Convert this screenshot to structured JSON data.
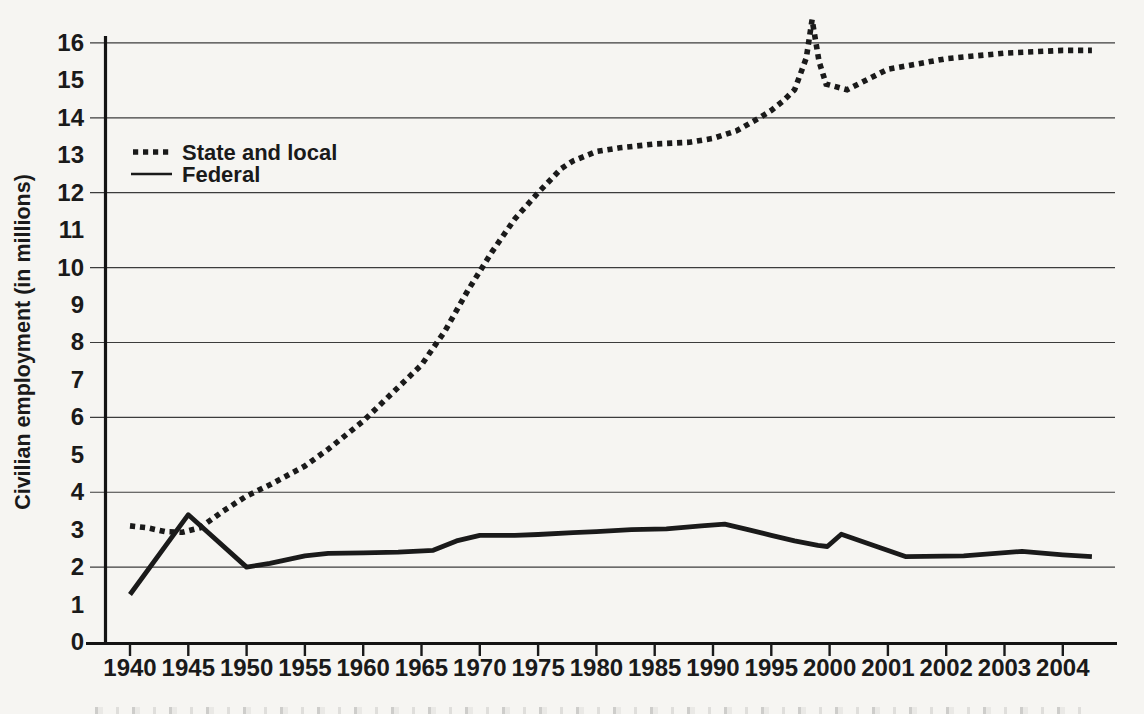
{
  "figure": {
    "background_color": "#f6f5f2",
    "ink_color": "#1a1a1a"
  },
  "chart_data": {
    "type": "line",
    "title": "",
    "xlabel": "",
    "ylabel": "Civilian employment (in millions)",
    "ylim": [
      0,
      16
    ],
    "y_tick_labels": [
      "0",
      "1",
      "2",
      "3",
      "4",
      "5",
      "6",
      "7",
      "8",
      "9",
      "10",
      "11",
      "12",
      "13",
      "14",
      "15",
      "16"
    ],
    "x_tick_labels": [
      "1940",
      "1945",
      "1950",
      "1955",
      "1960",
      "1965",
      "1970",
      "1975",
      "1980",
      "1985",
      "1990",
      "1995",
      "2000",
      "2001",
      "2002",
      "2003",
      "2004"
    ],
    "x_axis_note": "ticks evenly spaced: 5-year steps 1940-2000, then 1-year steps 2000-2004",
    "grid": "horizontal gridlines at even values 2 through 16 only",
    "legend_position": "upper left inside plot",
    "legend": [
      {
        "label": "State and local",
        "style": "dotted"
      },
      {
        "label": "Federal",
        "style": "solid"
      }
    ],
    "series": [
      {
        "name": "State and local",
        "style": "dotted",
        "values_at_ticks": [
          3.1,
          2.95,
          3.9,
          4.7,
          5.9,
          7.4,
          9.9,
          12.0,
          13.1,
          13.3,
          13.45,
          14.2,
          14.8,
          15.3,
          15.6,
          15.75,
          15.8
        ],
        "peak": {
          "year": 1998.5,
          "value": 16.6
        },
        "points": [
          [
            1940,
            3.1
          ],
          [
            1941.5,
            3.05
          ],
          [
            1943,
            2.95
          ],
          [
            1944.5,
            2.93
          ],
          [
            1946,
            3.05
          ],
          [
            1948,
            3.5
          ],
          [
            1950,
            3.9
          ],
          [
            1952,
            4.2
          ],
          [
            1955,
            4.7
          ],
          [
            1957,
            5.15
          ],
          [
            1960,
            5.9
          ],
          [
            1962,
            6.5
          ],
          [
            1965,
            7.4
          ],
          [
            1967,
            8.3
          ],
          [
            1969,
            9.4
          ],
          [
            1970,
            9.9
          ],
          [
            1971,
            10.4
          ],
          [
            1973,
            11.3
          ],
          [
            1975,
            12.0
          ],
          [
            1977,
            12.65
          ],
          [
            1978,
            12.85
          ],
          [
            1980,
            13.1
          ],
          [
            1982,
            13.2
          ],
          [
            1985,
            13.3
          ],
          [
            1988,
            13.35
          ],
          [
            1990,
            13.45
          ],
          [
            1992,
            13.65
          ],
          [
            1994,
            14.0
          ],
          [
            1995,
            14.2
          ],
          [
            1996,
            14.45
          ],
          [
            1997,
            14.75
          ],
          [
            1998,
            15.6
          ],
          [
            1998.5,
            16.62
          ],
          [
            1999.1,
            15.5
          ],
          [
            1999.7,
            14.9
          ],
          [
            2000.3,
            14.75
          ],
          [
            2001,
            15.3
          ],
          [
            2002,
            15.58
          ],
          [
            2003,
            15.73
          ],
          [
            2004,
            15.8
          ],
          [
            2004.5,
            15.8
          ]
        ]
      },
      {
        "name": "Federal",
        "style": "solid",
        "values_at_ticks": [
          1.3,
          3.4,
          2.0,
          2.3,
          2.4,
          2.4,
          2.85,
          2.87,
          2.95,
          3.0,
          3.15,
          2.85,
          2.6,
          2.3,
          2.3,
          2.4,
          2.3
        ],
        "points": [
          [
            1940,
            1.27
          ],
          [
            1945,
            3.4
          ],
          [
            1950,
            2.0
          ],
          [
            1952,
            2.1
          ],
          [
            1955,
            2.3
          ],
          [
            1957,
            2.37
          ],
          [
            1960,
            2.38
          ],
          [
            1963,
            2.4
          ],
          [
            1966,
            2.45
          ],
          [
            1968,
            2.7
          ],
          [
            1970,
            2.85
          ],
          [
            1973,
            2.85
          ],
          [
            1975,
            2.87
          ],
          [
            1978,
            2.92
          ],
          [
            1980,
            2.95
          ],
          [
            1983,
            3.0
          ],
          [
            1986,
            3.02
          ],
          [
            1989,
            3.1
          ],
          [
            1991,
            3.15
          ],
          [
            1993,
            3.0
          ],
          [
            1995,
            2.85
          ],
          [
            1997,
            2.7
          ],
          [
            1999,
            2.58
          ],
          [
            1999.8,
            2.55
          ],
          [
            2000.2,
            2.88
          ],
          [
            2001.3,
            2.28
          ],
          [
            2002.3,
            2.3
          ],
          [
            2003.3,
            2.42
          ],
          [
            2004,
            2.33
          ],
          [
            2004.5,
            2.28
          ]
        ]
      }
    ]
  }
}
